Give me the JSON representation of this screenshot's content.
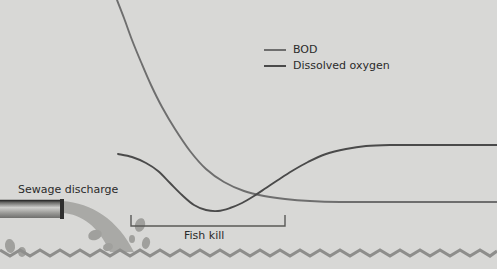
{
  "figure": {
    "background_color": "#d8d8d6",
    "width": 497,
    "height": 269
  },
  "legend": {
    "position": "top-center-right",
    "items": [
      {
        "label": "BOD",
        "color": "#6e6e6e",
        "swatch": "line-swatch"
      },
      {
        "label": "Dissolved oxygen",
        "color": "#4a4a4a",
        "swatch": "line-swatch"
      }
    ]
  },
  "annotations": {
    "sewage_discharge": "Sewage discharge",
    "fish_kill": "Fish kill"
  },
  "scene": {
    "water_line_color": "#8e8e8c",
    "pipe_color_dark": "#3a3a3a",
    "pipe_color_light": "#cfcfcd",
    "discharge_color": "#a9a9a6",
    "droplet_color": "#a0a09d"
  },
  "chart_data": {
    "type": "line",
    "title": "",
    "subtitle": "",
    "xlabel": "Distance downstream",
    "ylabel": "Concentration",
    "grid": false,
    "legend_position": "upper right",
    "annotations": [
      {
        "text": "Sewage discharge",
        "x_px": 18,
        "y_px": 184
      },
      {
        "text": "Fish kill",
        "x_px": 184,
        "y_px": 230,
        "bracket_x_start_px": 131,
        "bracket_x_end_px": 285
      }
    ],
    "crossing_point": {
      "x_px": 272,
      "y_px": 190
    },
    "series": [
      {
        "name": "BOD",
        "color": "#6e6e6e",
        "description": "Peaks at the sewage discharge point then decays downstream to a low plateau",
        "points_px": [
          [
            117,
            0
          ],
          [
            124,
            18
          ],
          [
            132,
            40
          ],
          [
            141,
            62
          ],
          [
            151,
            85
          ],
          [
            162,
            107
          ],
          [
            175,
            129
          ],
          [
            190,
            151
          ],
          [
            206,
            169
          ],
          [
            224,
            182
          ],
          [
            244,
            191
          ],
          [
            264,
            196
          ],
          [
            285,
            199
          ],
          [
            310,
            201
          ],
          [
            340,
            202
          ],
          [
            380,
            202
          ],
          [
            430,
            202
          ],
          [
            497,
            202
          ]
        ]
      },
      {
        "name": "Dissolved oxygen",
        "color": "#4a4a4a",
        "description": "Sags to a minimum in the fish-kill zone then recovers to a high plateau",
        "points_px": [
          [
            118,
            154
          ],
          [
            132,
            157
          ],
          [
            146,
            163
          ],
          [
            158,
            171
          ],
          [
            170,
            183
          ],
          [
            182,
            195
          ],
          [
            194,
            205
          ],
          [
            206,
            210
          ],
          [
            218,
            211
          ],
          [
            230,
            208
          ],
          [
            242,
            203
          ],
          [
            254,
            196
          ],
          [
            266,
            188
          ],
          [
            278,
            180
          ],
          [
            292,
            171
          ],
          [
            308,
            162
          ],
          [
            326,
            154
          ],
          [
            346,
            149
          ],
          [
            366,
            146
          ],
          [
            390,
            145
          ],
          [
            420,
            145
          ],
          [
            460,
            145
          ],
          [
            497,
            145
          ]
        ]
      }
    ]
  }
}
